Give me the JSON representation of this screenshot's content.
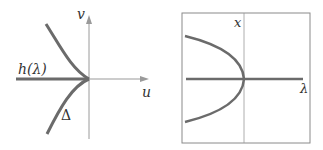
{
  "left_panel": {
    "axis_labels": {
      "vertical": "v",
      "horizontal": "u"
    },
    "curve_labels": {
      "horizontal_line": "h(λ)",
      "cusp": "Δ"
    },
    "colors": {
      "curve": "#6b6b6b",
      "axis": "#9a9a9a",
      "text": "#333333"
    }
  },
  "right_panel": {
    "axis_labels": {
      "vertical": "x",
      "horizontal": "λ"
    },
    "colors": {
      "curve": "#6b6b6b",
      "axis": "#9a9a9a",
      "frame": "#8a8a8a"
    }
  }
}
